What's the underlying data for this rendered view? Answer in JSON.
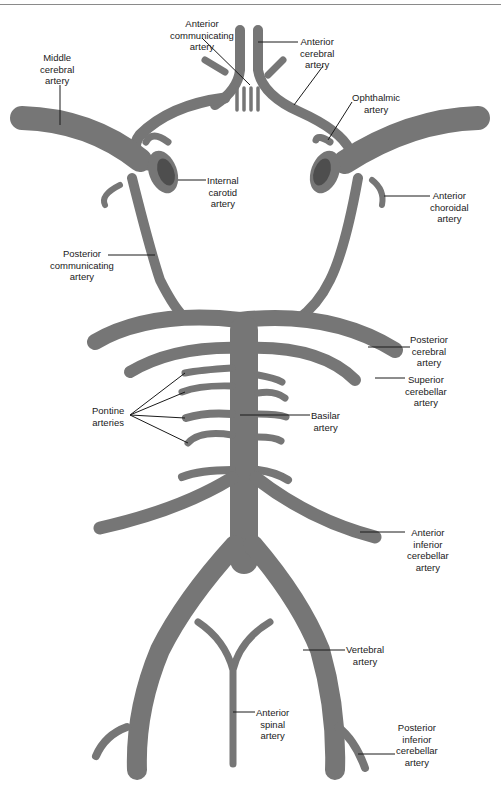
{
  "colors": {
    "artery": "#767676",
    "lumen": "#4e4e4e",
    "leader": "#1a1a1a",
    "background": "#ffffff"
  },
  "labels": {
    "anterior_communicating": "Anterior\ncommunicating\nartery",
    "anterior_cerebral": "Anterior\ncerebral\nartery",
    "middle_cerebral": "Middle\ncerebral\nartery",
    "ophthalmic": "Ophthalmic\nartery",
    "internal_carotid": "Internal\ncarotid\nartery",
    "anterior_choroidal": "Anterior\nchoroidal\nartery",
    "posterior_communicating": "Posterior\ncommunicating\nartery",
    "posterior_cerebral": "Posterior\ncerebral\nartery",
    "superior_cerebellar": "Superior\ncerebellar\nartery",
    "pontine": "Pontine\narteries",
    "basilar": "Basilar\nartery",
    "anterior_inferior_cerebellar": "Anterior\ninferior\ncerebellar\nartery",
    "vertebral": "Vertebral\nartery",
    "anterior_spinal": "Anterior\nspinal\nartery",
    "posterior_inferior_cerebellar": "Posterior\ninferior\ncerebellar\nartery"
  }
}
